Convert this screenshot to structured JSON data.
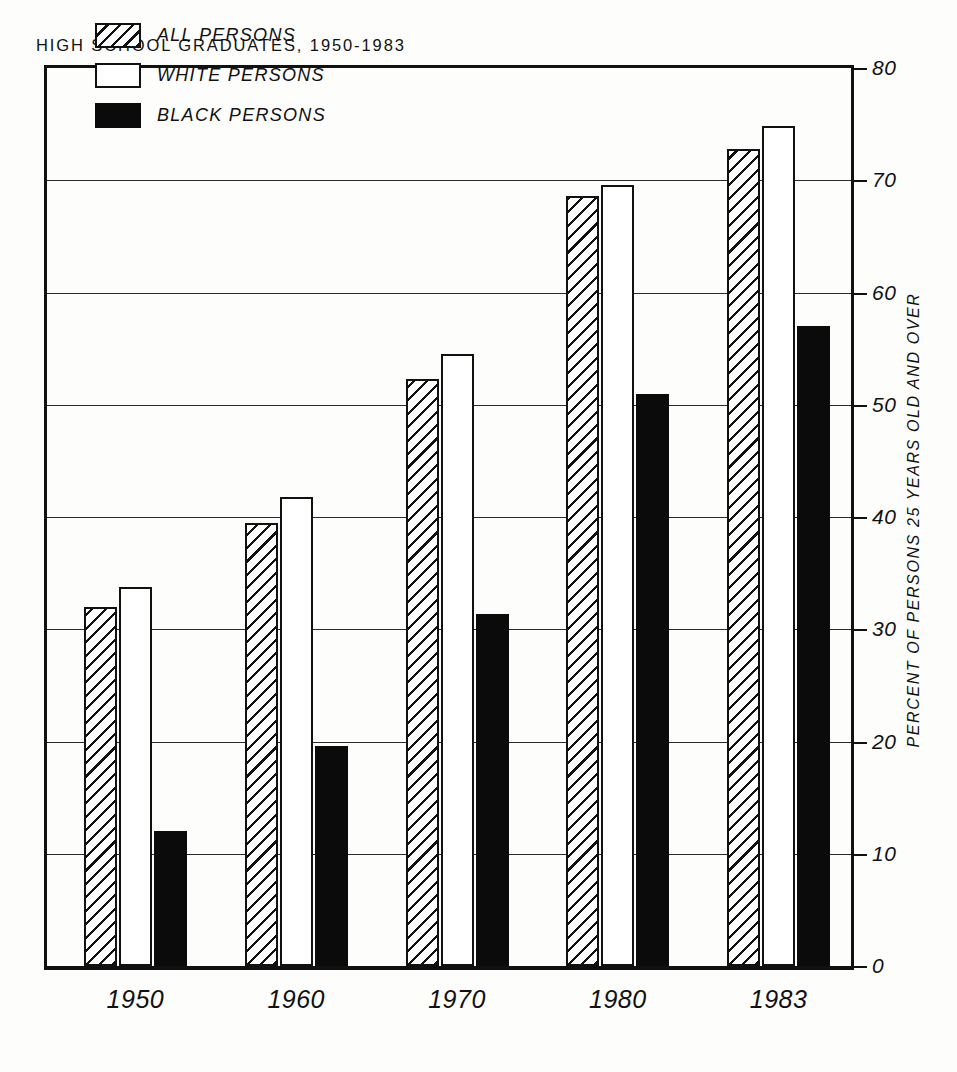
{
  "chart_data": {
    "type": "bar",
    "title": "HIGH SCHOOL GRADUATES, 1950-1983",
    "xlabel": "",
    "ylabel": "PERCENT OF PERSONS 25 YEARS OLD AND OVER",
    "categories": [
      "1950",
      "1960",
      "1970",
      "1980",
      "1983"
    ],
    "series": [
      {
        "name": "ALL PERSONS",
        "key": "all",
        "fill": "hatched",
        "values": [
          32.0,
          39.5,
          52.3,
          68.6,
          72.8
        ]
      },
      {
        "name": "WHITE PERSONS",
        "key": "white",
        "fill": "white",
        "values": [
          33.8,
          41.8,
          54.5,
          69.6,
          74.8
        ]
      },
      {
        "name": "BLACK PERSONS",
        "key": "black",
        "fill": "black",
        "values": [
          12.0,
          19.6,
          31.4,
          51.0,
          57.0
        ]
      }
    ],
    "ylim": [
      0,
      80
    ],
    "yticks": [
      "0",
      "10",
      "20",
      "30",
      "40",
      "50",
      "60",
      "70",
      "80"
    ],
    "ytick_values": [
      0,
      10,
      20,
      30,
      40,
      50,
      60,
      70,
      80
    ],
    "grid": true,
    "legend_position": "top-left"
  },
  "legend": {
    "items": [
      {
        "label": "ALL PERSONS",
        "swatch": "hatched"
      },
      {
        "label": "WHITE PERSONS",
        "swatch": "white"
      },
      {
        "label": "BLACK PERSONS",
        "swatch": "black"
      }
    ]
  },
  "colors": {
    "ink": "#111111",
    "background": "#fdfdfb",
    "black_series": "#0b0b0b",
    "white_series": "#ffffff"
  }
}
